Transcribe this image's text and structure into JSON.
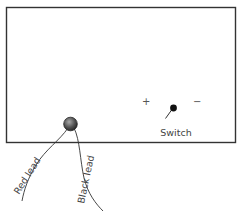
{
  "diagram": {
    "type": "instrument-sketch",
    "colors": {
      "outline": "#333333",
      "knob_dark": "#3a3a3a",
      "knob_light": "#9a9a9a",
      "text": "#444444",
      "background": "#ffffff"
    },
    "labels": {
      "switch": "Switch",
      "plus": "+",
      "minus": "−",
      "red_lead": "Red lead",
      "black_lead": "Black lead"
    },
    "elements": [
      {
        "id": "body",
        "kind": "rectangle",
        "description": "instrument body outline"
      },
      {
        "id": "terminal-knob",
        "kind": "circle",
        "description": "lead connection terminal"
      },
      {
        "id": "switch",
        "kind": "toggle-switch",
        "positions": [
          "+",
          "−"
        ]
      },
      {
        "id": "red-lead",
        "kind": "wire",
        "label": "Red lead"
      },
      {
        "id": "black-lead",
        "kind": "wire",
        "label": "Black lead"
      }
    ]
  }
}
